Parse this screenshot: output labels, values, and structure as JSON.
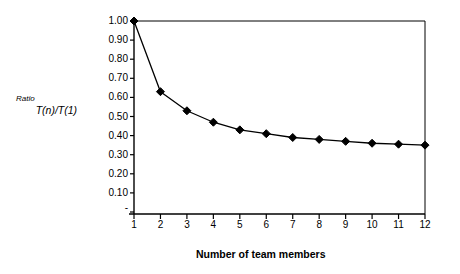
{
  "chart_data": {
    "type": "line",
    "title": "",
    "xlabel": "Number of team members",
    "ylabel_prefix": "Ratio",
    "ylabel_main": "T(n)/T(1)",
    "x": [
      1,
      2,
      3,
      4,
      5,
      6,
      7,
      8,
      9,
      10,
      11,
      12
    ],
    "categories": [
      "1",
      "2",
      "3",
      "4",
      "5",
      "6",
      "7",
      "8",
      "9",
      "10",
      "11",
      "12"
    ],
    "values": [
      1.0,
      0.63,
      0.53,
      0.47,
      0.43,
      0.41,
      0.39,
      0.38,
      0.37,
      0.36,
      0.355,
      0.35
    ],
    "series": [
      {
        "name": "T(n)/T(1)",
        "values": [
          1.0,
          0.63,
          0.53,
          0.47,
          0.43,
          0.41,
          0.39,
          0.38,
          0.37,
          0.36,
          0.355,
          0.35
        ]
      }
    ],
    "xlim": [
      1,
      12
    ],
    "ylim": [
      0.0,
      1.0
    ],
    "ytick_labels": [
      "1.00",
      "0.90",
      "0.80",
      "0.70",
      "0.60",
      "0.50",
      "0.40",
      "0.30",
      "0.20",
      "0.10",
      "-"
    ],
    "ytick_values": [
      1.0,
      0.9,
      0.8,
      0.7,
      0.6,
      0.5,
      0.4,
      0.3,
      0.2,
      0.1,
      0.0
    ],
    "xtick_labels": [
      "1",
      "2",
      "3",
      "4",
      "5",
      "6",
      "7",
      "8",
      "9",
      "10",
      "11",
      "12"
    ],
    "grid": false,
    "legend": false,
    "legend_position": "none",
    "marker": "diamond",
    "line_color": "#000000",
    "marker_color": "#000000",
    "background_color": "#ffffff",
    "plot_border": "top-right-only"
  }
}
